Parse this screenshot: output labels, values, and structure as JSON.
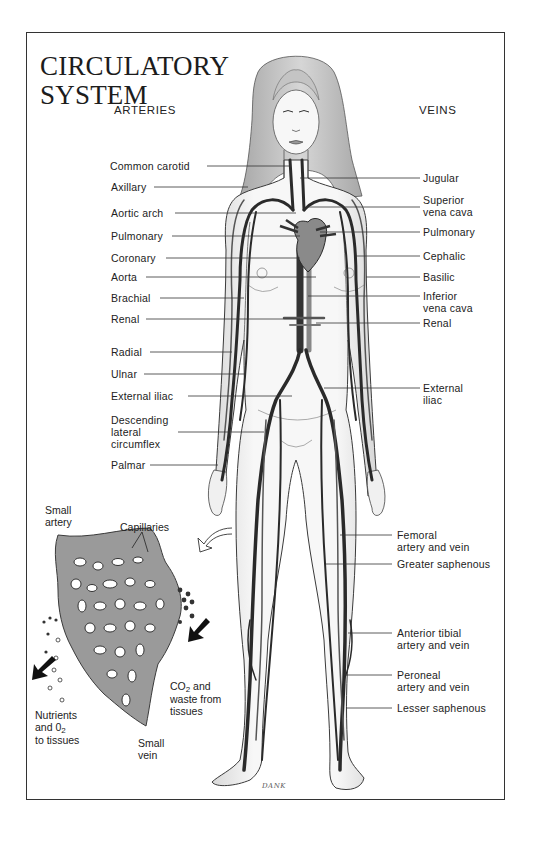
{
  "title": {
    "line1": "CIRCULATORY",
    "line2": "SYSTEM"
  },
  "columns": {
    "arteries": "ARTERIES",
    "veins": "VEINS"
  },
  "artery_labels": [
    {
      "text": "Common carotid",
      "y": 166
    },
    {
      "text": "Axillary",
      "y": 187
    },
    {
      "text": "Aortic arch",
      "y": 213
    },
    {
      "text": "Pulmonary",
      "y": 236
    },
    {
      "text": "Coronary",
      "y": 258
    },
    {
      "text": "Aorta",
      "y": 277
    },
    {
      "text": "Brachial",
      "y": 298
    },
    {
      "text": "Renal",
      "y": 319
    },
    {
      "text": "Radial",
      "y": 352
    },
    {
      "text": "Ulnar",
      "y": 374
    },
    {
      "text": "External iliac",
      "y": 396
    },
    {
      "text": "Descending",
      "y2": "lateral",
      "y3": "circumflex",
      "yy": 420
    },
    {
      "text": "Palmar",
      "y": 465
    }
  ],
  "vein_labels": {
    "jugular": "Jugular",
    "superior_vena_cava_1": "Superior",
    "superior_vena_cava_2": "vena cava",
    "pulmonary": "Pulmonary",
    "cephalic": "Cephalic",
    "basilic": "Basilic",
    "inferior_vena_cava_1": "Inferior",
    "inferior_vena_cava_2": "vena cava",
    "renal": "Renal",
    "external_iliac_1": "External",
    "external_iliac_2": "iliac",
    "femoral_1": "Femoral",
    "femoral_2": "artery and vein",
    "greater_saphenous": "Greater saphenous",
    "anterior_tibial_1": "Anterior tibial",
    "anterior_tibial_2": "artery and vein",
    "peroneal_1": "Peroneal",
    "peroneal_2": "artery and vein",
    "lesser_saphenous": "Lesser saphenous"
  },
  "left_labels": {
    "common_carotid": "Common carotid",
    "axillary": "Axillary",
    "aortic_arch": "Aortic arch",
    "pulmonary": "Pulmonary",
    "coronary": "Coronary",
    "aorta": "Aorta",
    "brachial": "Brachial",
    "renal": "Renal",
    "radial": "Radial",
    "ulnar": "Ulnar",
    "external_iliac": "External iliac",
    "desc_lat_circ_1": "Descending",
    "desc_lat_circ_2": "lateral",
    "desc_lat_circ_3": "circumflex",
    "palmar": "Palmar"
  },
  "inset": {
    "small_artery_1": "Small",
    "small_artery_2": "artery",
    "capillaries": "Capillaries",
    "co2_1_a": "CO",
    "co2_1_sub": "2",
    "co2_1_b": " and",
    "co2_2": "waste from",
    "co2_3": "tissues",
    "nutrients_1": "Nutrients",
    "nutrients_2_a": "and 0",
    "nutrients_2_sub": "2",
    "nutrients_3": "to tissues",
    "small_vein_1": "Small",
    "small_vein_2": "vein"
  },
  "signature": "DANK",
  "colors": {
    "ink": "#1a1a1a",
    "vessel": "#2b2b2b",
    "skin": "#f2f2f2",
    "hair": "#bdbdbd",
    "border": "#333333"
  }
}
